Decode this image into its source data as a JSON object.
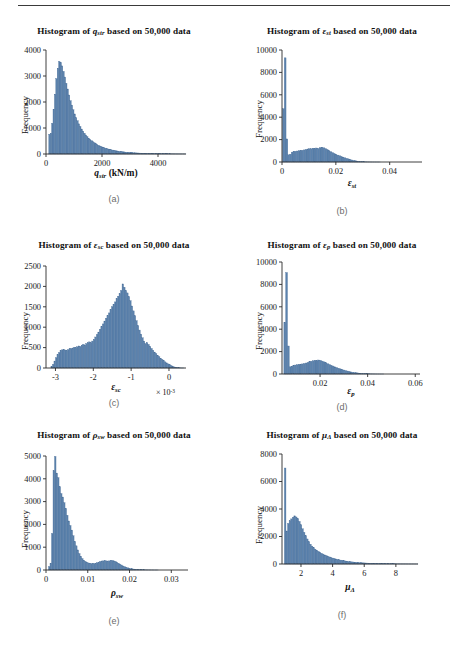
{
  "figure": {
    "divider": true,
    "bar_color": "#5b82ad",
    "bar_edge_color": "#4a6f99",
    "axis_color": "#2a2a2a",
    "caption_color": "#6b6b6b"
  },
  "panels": [
    {
      "id": "a",
      "caption": "(a)",
      "chart_data": {
        "type": "bar",
        "title": "Histogram of q_str based on 50,000 data",
        "title_parts": {
          "prefix": "Histogram of ",
          "symbol": "q",
          "symbol_sub": "str",
          "suffix": " based on 50,000 data"
        },
        "xlabel": "q_str (kN/m)",
        "xlabel_parts": {
          "symbol": "q",
          "symbol_sub": "str",
          "units": " (kN/m)"
        },
        "ylabel": "Frequency",
        "xlim": [
          0,
          5000
        ],
        "ylim": [
          0,
          4000
        ],
        "xticks": [
          0,
          2000,
          4000
        ],
        "xtick_labels": [
          "0",
          "2000",
          "4000"
        ],
        "yticks": [
          0,
          1000,
          2000,
          3000,
          4000
        ],
        "ytick_labels": [
          "0",
          "1000",
          "2000",
          "3000",
          "4000"
        ],
        "grid": false,
        "legend": null,
        "exponent": null,
        "bin_width": 50,
        "bin_start": 100,
        "values": [
          760,
          800,
          1180,
          1720,
          2300,
          2900,
          3300,
          3560,
          3520,
          3390,
          3180,
          2960,
          2720,
          2500,
          2270,
          2050,
          1880,
          1700,
          1540,
          1400,
          1280,
          1160,
          1060,
          960,
          880,
          800,
          730,
          670,
          610,
          560,
          515,
          470,
          432,
          398,
          366,
          336,
          310,
          286,
          264,
          244,
          226,
          208,
          192,
          178,
          164,
          152,
          140,
          130,
          120,
          111,
          103,
          95,
          88,
          82,
          76,
          70,
          65,
          60,
          56,
          52,
          48,
          45,
          42,
          39,
          36,
          33,
          31,
          29,
          27,
          25,
          23,
          21,
          20,
          18,
          17,
          16,
          15,
          14,
          13,
          12,
          11,
          10,
          9,
          9,
          8,
          7,
          7,
          6,
          6,
          5,
          5,
          4,
          4,
          4,
          3,
          3,
          3,
          2,
          2,
          2
        ]
      }
    },
    {
      "id": "b",
      "caption": "(b)",
      "chart_data": {
        "type": "bar",
        "title": "Histogram of ε_st based on 50,000 data",
        "title_parts": {
          "prefix": "Histogram of ",
          "symbol": "ε",
          "symbol_sub": "st",
          "suffix": " based on 50,000 data"
        },
        "xlabel": "ε_st",
        "xlabel_parts": {
          "symbol": "ε",
          "symbol_sub": "st",
          "units": ""
        },
        "ylabel": "Frequency",
        "xlim": [
          0,
          0.052
        ],
        "ylim": [
          0,
          10000
        ],
        "xticks": [
          0,
          0.02,
          0.04
        ],
        "xtick_labels": [
          "0",
          "0.02",
          "0.04"
        ],
        "yticks": [
          0,
          2000,
          4000,
          6000,
          8000,
          10000
        ],
        "ytick_labels": [
          "0",
          "2000",
          "4000",
          "6000",
          "8000",
          "10000"
        ],
        "grid": false,
        "legend": null,
        "exponent": null,
        "bin_width": 0.00065,
        "bin_start": 0.0002,
        "values": [
          4760,
          9300,
          2060,
          640,
          700,
          880,
          930,
          960,
          980,
          1000,
          1020,
          1050,
          1080,
          1120,
          1160,
          1190,
          1180,
          1230,
          1200,
          1250,
          1210,
          1270,
          1300,
          1270,
          1200,
          1120,
          1020,
          930,
          840,
          760,
          690,
          620,
          560,
          500,
          440,
          380,
          330,
          280,
          230,
          185,
          145,
          110,
          82,
          60,
          42,
          30,
          20,
          14,
          9,
          6,
          4,
          3,
          2,
          1,
          1,
          1,
          0,
          0,
          0,
          0
        ]
      }
    },
    {
      "id": "c",
      "caption": "(c)",
      "chart_data": {
        "type": "bar",
        "title": "Histogram of ε_sc based on 50,000 data",
        "title_parts": {
          "prefix": "Histogram of ",
          "symbol": "ε",
          "symbol_sub": "sc",
          "suffix": " based on 50,000 data"
        },
        "xlabel": "ε_sc",
        "xlabel_parts": {
          "symbol": "ε",
          "symbol_sub": "sc",
          "units": ""
        },
        "ylabel": "Frequency",
        "xlim": [
          -3.25,
          0.45
        ],
        "ylim": [
          0,
          2500
        ],
        "xticks": [
          -3,
          -2,
          -1,
          0
        ],
        "xtick_labels": [
          "-3",
          "-2",
          "-1",
          "0"
        ],
        "yticks": [
          0,
          500,
          1000,
          1500,
          2000,
          2500
        ],
        "ytick_labels": [
          "0",
          "500",
          "1000",
          "1500",
          "2000",
          "2500"
        ],
        "grid": false,
        "legend": null,
        "exponent": "× 10",
        "exponent_power": "-3",
        "bin_width": 0.04,
        "bin_start": -3.12,
        "values": [
          40,
          90,
          170,
          250,
          330,
          380,
          430,
          445,
          455,
          440,
          430,
          450,
          470,
          480,
          490,
          510,
          500,
          520,
          540,
          530,
          560,
          580,
          560,
          600,
          620,
          640,
          620,
          660,
          700,
          760,
          820,
          880,
          950,
          1010,
          1080,
          1150,
          1220,
          1280,
          1350,
          1430,
          1500,
          1560,
          1620,
          1700,
          1760,
          1820,
          1900,
          2060,
          1980,
          1900,
          1840,
          1750,
          1650,
          1520,
          1400,
          1280,
          1160,
          1040,
          930,
          830,
          740,
          660,
          600,
          620,
          580,
          530,
          480,
          430,
          390,
          350,
          310,
          275,
          240,
          210,
          180,
          150,
          125,
          100,
          78,
          58,
          40,
          26,
          16,
          9,
          5,
          3,
          1,
          1,
          0,
          0
        ]
      }
    },
    {
      "id": "d",
      "caption": "(d)",
      "chart_data": {
        "type": "bar",
        "title": "Histogram of ε_p based on 50,000 data",
        "title_parts": {
          "prefix": "Histogram of ",
          "symbol": "ε",
          "symbol_sub": "p",
          "suffix": " based on 50,000 data"
        },
        "xlabel": "ε_p",
        "xlabel_parts": {
          "symbol": "ε",
          "symbol_sub": "p",
          "units": ""
        },
        "ylabel": "Frequency",
        "xlim": [
          0.004,
          0.062
        ],
        "ylim": [
          0,
          10000
        ],
        "xticks": [
          0.02,
          0.04,
          0.06
        ],
        "xtick_labels": [
          "0.02",
          "0.04",
          "0.06"
        ],
        "yticks": [
          0,
          2000,
          4000,
          6000,
          8000,
          10000
        ],
        "ytick_labels": [
          "0",
          "2000",
          "4000",
          "6000",
          "8000",
          "10000"
        ],
        "grid": false,
        "legend": null,
        "exponent": null,
        "bin_width": 0.00075,
        "bin_start": 0.0048,
        "values": [
          4620,
          9060,
          2500,
          640,
          700,
          760,
          800,
          830,
          860,
          880,
          900,
          940,
          980,
          1030,
          1090,
          1140,
          1180,
          1220,
          1190,
          1250,
          1220,
          1150,
          1080,
          1000,
          920,
          850,
          780,
          710,
          640,
          580,
          520,
          460,
          410,
          360,
          310,
          265,
          225,
          190,
          160,
          132,
          108,
          86,
          68,
          52,
          40,
          30,
          22,
          16,
          11,
          8,
          5,
          4,
          2,
          2,
          1,
          1,
          0,
          0,
          0,
          0,
          0,
          0,
          0,
          0,
          0,
          0,
          0,
          0,
          0,
          0
        ]
      }
    },
    {
      "id": "e",
      "caption": "(e)",
      "chart_data": {
        "type": "bar",
        "title": "Histogram of ρ_sw based on 50,000 data",
        "title_parts": {
          "prefix": "Histogram of ",
          "symbol": "ρ",
          "symbol_sub": "sw",
          "suffix": " based on 50,000 data"
        },
        "xlabel": "ρ_sw",
        "xlabel_parts": {
          "symbol": "ρ",
          "symbol_sub": "sw",
          "units": ""
        },
        "ylabel": "Frequency",
        "xlim": [
          0,
          0.034
        ],
        "ylim": [
          0,
          5000
        ],
        "xticks": [
          0,
          0.01,
          0.02,
          0.03
        ],
        "xtick_labels": [
          "0",
          "0.01",
          "0.02",
          "0.03"
        ],
        "yticks": [
          0,
          1000,
          2000,
          3000,
          4000,
          5000
        ],
        "ytick_labels": [
          "0",
          "1000",
          "2000",
          "3000",
          "4000",
          "5000"
        ],
        "grid": false,
        "legend": null,
        "exponent": null,
        "bin_width": 0.00036,
        "bin_start": 0.0006,
        "values": [
          150,
          300,
          1600,
          4350,
          4980,
          4250,
          4050,
          3650,
          3350,
          3200,
          2950,
          2700,
          2400,
          2150,
          1950,
          1750,
          1500,
          1250,
          1060,
          880,
          720,
          600,
          500,
          430,
          380,
          340,
          310,
          290,
          280,
          275,
          285,
          300,
          320,
          345,
          375,
          395,
          400,
          405,
          400,
          390,
          400,
          415,
          420,
          400,
          380,
          340,
          300,
          260,
          220,
          180,
          150,
          120,
          98,
          80,
          64,
          52,
          42,
          34,
          27,
          22,
          17,
          14,
          11,
          9,
          7,
          5,
          4,
          3,
          2,
          2,
          1,
          1,
          1,
          0,
          0,
          0,
          0,
          0,
          0,
          0
        ]
      }
    },
    {
      "id": "f",
      "caption": "(f)",
      "chart_data": {
        "type": "bar",
        "title": "Histogram of μ_Δ based on 50,000 data",
        "title_parts": {
          "prefix": "Histogram of ",
          "symbol": "μ",
          "symbol_sub": "Δ",
          "suffix": " based on 50,000 data"
        },
        "xlabel": "μ_Δ",
        "xlabel_parts": {
          "symbol": "μ",
          "symbol_sub": "Δ",
          "units": ""
        },
        "ylabel": "Frequency",
        "xlim": [
          0.8,
          9.4
        ],
        "ylim": [
          0,
          8000
        ],
        "xticks": [
          2,
          4,
          6,
          8
        ],
        "xtick_labels": [
          "2",
          "4",
          "6",
          "8"
        ],
        "yticks": [
          0,
          2000,
          4000,
          6000,
          8000
        ],
        "ytick_labels": [
          "0",
          "2000",
          "4000",
          "6000",
          "8000"
        ],
        "grid": false,
        "legend": null,
        "exponent": null,
        "bin_width": 0.1,
        "bin_start": 0.95,
        "values": [
          6980,
          2400,
          2950,
          3150,
          3280,
          3400,
          3500,
          3420,
          3300,
          3100,
          2850,
          2560,
          2300,
          2050,
          1820,
          1620,
          1440,
          1300,
          1180,
          1080,
          1000,
          920,
          850,
          780,
          720,
          660,
          610,
          560,
          515,
          475,
          435,
          400,
          368,
          338,
          310,
          285,
          262,
          240,
          220,
          202,
          185,
          170,
          156,
          143,
          131,
          120,
          110,
          101,
          93,
          85,
          78,
          71,
          65,
          60,
          55,
          50,
          46,
          42,
          38,
          35,
          32,
          29,
          27,
          24,
          22,
          20,
          18,
          17,
          15,
          14,
          12,
          11,
          10,
          9,
          8,
          7,
          7,
          6,
          5,
          5,
          4,
          4,
          3,
          3,
          3,
          2,
          2,
          2
        ]
      }
    }
  ]
}
